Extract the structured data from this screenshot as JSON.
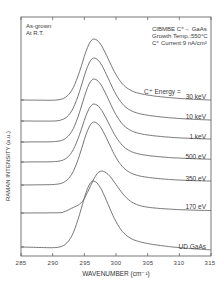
{
  "chart_data": {
    "type": "line",
    "title": "",
    "xlabel": "WAVENUMBER (cm⁻¹)",
    "ylabel": "RAMAN INTENSITY (a.u.)",
    "xlim": [
      285,
      315
    ],
    "x_ticks": [
      285,
      290,
      295,
      300,
      305,
      310,
      315
    ],
    "y_ticks_labeled": false,
    "grid": false,
    "legend_position": "inline-right",
    "annotations": {
      "top_left": [
        "As-grown",
        "At R.T."
      ],
      "top_right": [
        "CIBMBE  C⁺→ GaAs",
        "Growth Temp.:550°C",
        "C⁺ Current:9 nA/cm²"
      ],
      "energy_label": "C⁺ Energy ="
    },
    "x": [
      285,
      287.5,
      290,
      292,
      294,
      295,
      296,
      297,
      298,
      299,
      300,
      302,
      305,
      308,
      311,
      315
    ],
    "series": [
      {
        "name": "30 keV",
        "peak_x": 296.5,
        "baseline_left": 100,
        "baseline_right": 102,
        "peak_y": 39
      },
      {
        "name": "10 keV",
        "peak_x": 296.5,
        "baseline_left": 121,
        "baseline_right": 122,
        "peak_y": 58
      },
      {
        "name": "1 keV",
        "peak_x": 296.5,
        "baseline_left": 142,
        "baseline_right": 141,
        "peak_y": 79
      },
      {
        "name": "500 eV",
        "peak_x": 296.5,
        "baseline_left": 162,
        "baseline_right": 161,
        "peak_y": 104
      },
      {
        "name": "350 eV",
        "peak_x": 296.5,
        "baseline_left": 185,
        "baseline_right": 183,
        "peak_y": 122
      },
      {
        "name": "170 eV",
        "peak_x": 297.7,
        "baseline_left": 213,
        "baseline_right": 212,
        "peak_y": 171
      },
      {
        "name": "UD GaAs",
        "peak_x": 296.4,
        "baseline_left": 247,
        "baseline_right": 252,
        "peak_y": 181
      }
    ]
  },
  "labels": {
    "as_grown": "As-grown",
    "at_rt": "At R.T.",
    "cibmbe": "CIBMBE  C⁺→ GaAs",
    "growth_temp": "Growth Temp.:550°C",
    "current": "C⁺ Current:9 nA/cm²",
    "energy": "C⁺ Energy =",
    "s0": "30 keV",
    "s1": "10 keV",
    "s2": "1 keV",
    "s3": "500 eV",
    "s4": "350 eV",
    "s5": "170 eV",
    "s6": "UD GaAs",
    "t0": "285",
    "t1": "290",
    "t2": "295",
    "t3": "300",
    "t4": "305",
    "t5": "310",
    "t6": "315",
    "xlabel": "WAVENUMBER (cm⁻¹)",
    "ylabel": "RAMAN INTENSITY (a.u.)"
  }
}
